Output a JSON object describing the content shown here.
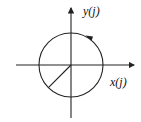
{
  "diagram": {
    "type": "unit-circle-phasor",
    "labels": {
      "y_axis": "y(j)",
      "x_axis": "x(j)"
    },
    "colors": {
      "stroke": "#222222",
      "background": "#ffffff"
    },
    "geometry": {
      "center": [
        71,
        65
      ],
      "radius": 32,
      "radius_line_angle_deg": 225,
      "rotation_direction": "counterclockwise"
    }
  }
}
